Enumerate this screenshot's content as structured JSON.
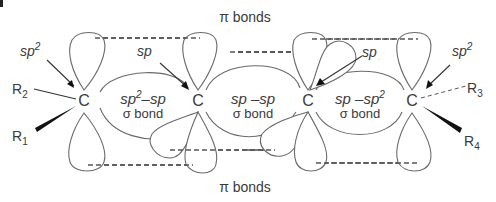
{
  "diagram": {
    "top_label": "π bonds",
    "bottom_label": "π bonds",
    "carbons": [
      {
        "symbol": "C",
        "hybrid_label": "sp",
        "hybrid_sup": "2"
      },
      {
        "symbol": "C",
        "hybrid_label": "sp",
        "hybrid_sup": ""
      },
      {
        "symbol": "C",
        "hybrid_label": "sp",
        "hybrid_sup": ""
      },
      {
        "symbol": "C",
        "hybrid_label": "sp",
        "hybrid_sup": "2"
      }
    ],
    "substituents": [
      {
        "label": "R",
        "sub": "2",
        "bond": "line"
      },
      {
        "label": "R",
        "sub": "1",
        "bond": "wedge"
      },
      {
        "label": "R",
        "sub": "3",
        "bond": "dashed"
      },
      {
        "label": "R",
        "sub": "4",
        "bond": "wedge"
      }
    ],
    "sigma_bonds": [
      {
        "left": "sp",
        "left_sup": "2",
        "sep": "–",
        "right": "sp",
        "right_sup": "",
        "caption": "σ bond"
      },
      {
        "left": "sp",
        "left_sup": "",
        "sep": " –",
        "right": "sp",
        "right_sup": "",
        "caption": "σ bond"
      },
      {
        "left": "sp",
        "left_sup": "",
        "sep": " –",
        "right": "sp",
        "right_sup": "2",
        "caption": "σ bond"
      }
    ],
    "colors": {
      "outline": "#6a6a6a",
      "text": "#3a3a3a",
      "background": "#ffffff"
    }
  }
}
